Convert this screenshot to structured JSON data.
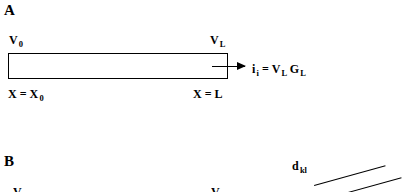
{
  "figure": {
    "background_color": "#ffffff",
    "ink_color": "#000000",
    "width": 402,
    "height": 192
  },
  "panel_a": {
    "letter": "A",
    "cable": {
      "label_left_top": {
        "base": "V",
        "sub": "0"
      },
      "label_right_top": {
        "base": "V",
        "sub": "L"
      },
      "label_left_bottom": {
        "lhs": "X",
        "op": "=",
        "base": "X",
        "sub": "0"
      },
      "label_right_bottom": {
        "lhs": "X",
        "op": "=",
        "rhs": "L"
      }
    },
    "current_equation": {
      "current_base": "i",
      "current_sub": "i",
      "op": "=",
      "term1_base": "V",
      "term1_sub": "L",
      "term2_base": "G",
      "term2_sub": "L"
    },
    "arrow": {
      "name": "current-arrow",
      "direction": "right"
    }
  },
  "panel_b": {
    "letter": "B",
    "distance_label": {
      "base": "d",
      "sub": "kl"
    },
    "clipped_labels": [
      {
        "base": "V"
      },
      {
        "base": "V"
      }
    ]
  }
}
